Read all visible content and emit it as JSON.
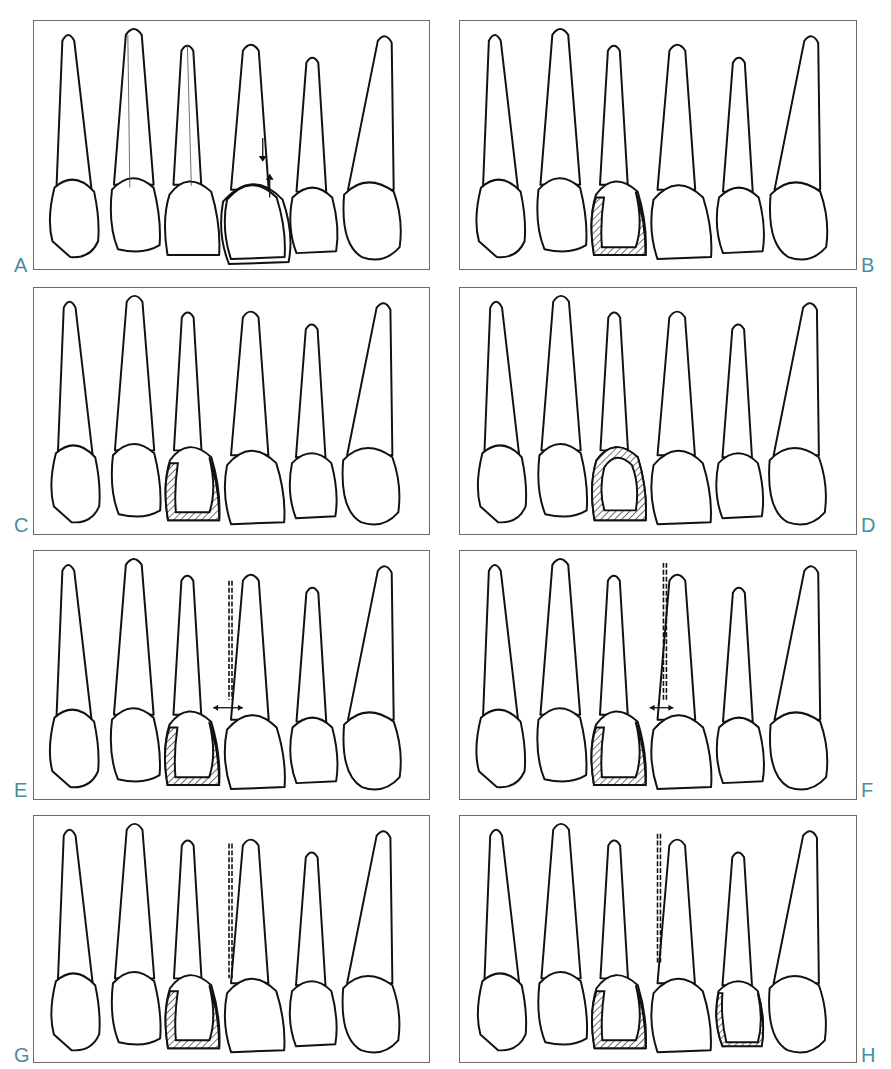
{
  "figure": {
    "panels": [
      {
        "id": "A",
        "label": "A",
        "label_side": "left",
        "restored_tooth": 4,
        "variant": "outline-arrows",
        "hatched_tooth": null,
        "gauge_line": false,
        "gap_arrow": false
      },
      {
        "id": "B",
        "label": "B",
        "label_side": "right",
        "restored_tooth": 3,
        "variant": "hatched-distal-incisal",
        "gauge_line": false,
        "gap_arrow": false
      },
      {
        "id": "C",
        "label": "C",
        "label_side": "left",
        "restored_tooth": 3,
        "variant": "hatched-distal-incisal",
        "gauge_line": false,
        "gap_arrow": false
      },
      {
        "id": "D",
        "label": "D",
        "label_side": "right",
        "restored_tooth": 3,
        "variant": "hatched-full-ring",
        "gauge_line": false,
        "gap_arrow": false
      },
      {
        "id": "E",
        "label": "E",
        "label_side": "left",
        "restored_tooth": 3,
        "variant": "hatched-distal-incisal",
        "gauge_line": true,
        "gap_arrow": true
      },
      {
        "id": "F",
        "label": "F",
        "label_side": "right",
        "restored_tooth": 3,
        "variant": "hatched-distal-incisal",
        "gauge_line": true,
        "gap_arrow": true
      },
      {
        "id": "G",
        "label": "G",
        "label_side": "left",
        "restored_tooth": 3,
        "variant": "hatched-distal-incisal",
        "gauge_line": true,
        "gap_arrow": false
      },
      {
        "id": "H",
        "label": "H",
        "label_side": "right",
        "restored_tooth": 3,
        "variant": "hatched-distal-incisal",
        "gauge_line": true,
        "gap_arrow": false,
        "secondary_hatched_tooth": 5
      }
    ],
    "teeth_per_panel": 6,
    "colors": {
      "label": "#4a8d9a",
      "outline": "#111111",
      "border": "#6a6a6a"
    }
  }
}
